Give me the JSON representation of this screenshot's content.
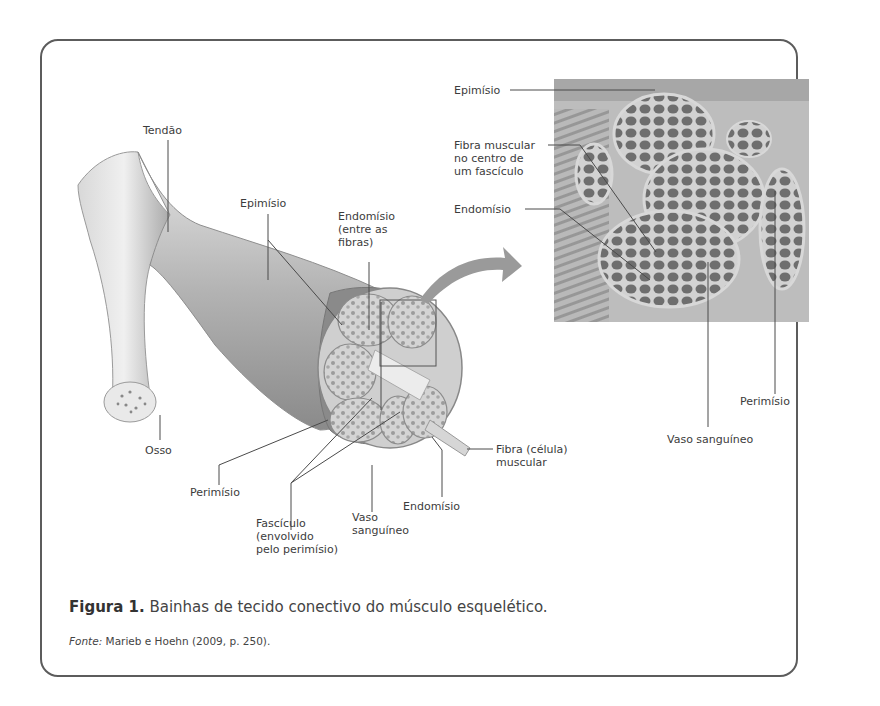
{
  "figure": {
    "caption_prefix": "Figura 1.",
    "caption_text": " Bainhas de tecido conectivo do músculo esquelético.",
    "source_prefix": "Fonte:",
    "source_text": " Marieb e Hoehn (2009, p. 250)."
  },
  "illustration_labels": {
    "tendao": "Tendão",
    "epimisio": "Epimísio",
    "endomisio_top": "Endomísio\n(entre as\nfibras)",
    "osso": "Osso",
    "perimisio": "Perimísio",
    "fasciculo": "Fascículo\n(envolvido\npelo perimísio)",
    "vaso": "Vaso\nsanguíneo",
    "endomisio_bottom": "Endomísio",
    "fibra": "Fibra (célula)\nmuscular"
  },
  "micrograph_labels": {
    "epimisio": "Epimísio",
    "fibra_centro": "Fibra muscular\nno centro de\num fascículo",
    "endomisio": "Endomísio",
    "perimisio": "Perimísio",
    "vaso": "Vaso sanguíneo"
  },
  "colors": {
    "frame": "#5c5c5c",
    "text": "#3c3c3c",
    "tissue_dark": "#6e6e6e",
    "tissue_light": "#c9c9c9"
  }
}
